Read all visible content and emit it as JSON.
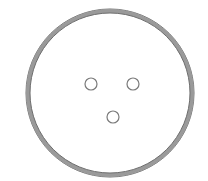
{
  "diagram": {
    "width": 208,
    "height": 181,
    "background": "#ffffff",
    "outer_circle": {
      "cx": 110,
      "cy": 93,
      "r": 82,
      "ring_color": "#9a9a9a",
      "edge_color": "#6e6e6e",
      "ring_width": 4
    },
    "holes": [
      {
        "cx": 91,
        "cy": 84,
        "r": 6,
        "stroke": "#7a7a7a"
      },
      {
        "cx": 133,
        "cy": 84,
        "r": 6,
        "stroke": "#7a7a7a"
      },
      {
        "cx": 113,
        "cy": 117,
        "r": 6,
        "stroke": "#7a7a7a"
      }
    ]
  }
}
